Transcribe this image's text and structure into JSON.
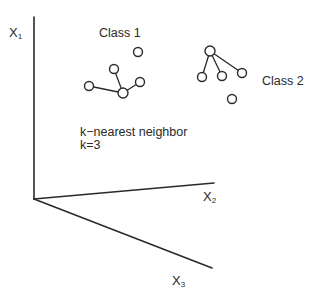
{
  "diagram": {
    "colors": {
      "ink": "#2a2a2a",
      "background": "#ffffff"
    },
    "axes": [
      {
        "id": "x1",
        "label": "X",
        "subscript": "1",
        "from": [
          34,
          199
        ],
        "to": [
          34,
          17
        ]
      },
      {
        "id": "x2",
        "label": "X",
        "subscript": "2",
        "from": [
          34,
          199
        ],
        "to": [
          214,
          183
        ]
      },
      {
        "id": "x3",
        "label": "X",
        "subscript": "3",
        "from": [
          34,
          199
        ],
        "to": [
          212,
          268
        ]
      }
    ],
    "classes": [
      {
        "label": "Class 1",
        "points": [
          [
            138,
            52
          ],
          [
            114,
            69
          ],
          [
            89,
            86
          ],
          [
            123,
            93
          ],
          [
            140,
            82
          ]
        ],
        "query_index": 3,
        "neighbor_indices": [
          1,
          2,
          4
        ]
      },
      {
        "label": "Class 2",
        "points": [
          [
            210,
            51
          ],
          [
            202,
            77
          ],
          [
            222,
            76
          ],
          [
            242,
            73
          ],
          [
            232,
            99
          ]
        ],
        "query_index": 0,
        "neighbor_indices": [
          1,
          2,
          3
        ]
      }
    ],
    "annotation": {
      "line1": "k−nearest neighbor",
      "line2": "k=3"
    }
  }
}
